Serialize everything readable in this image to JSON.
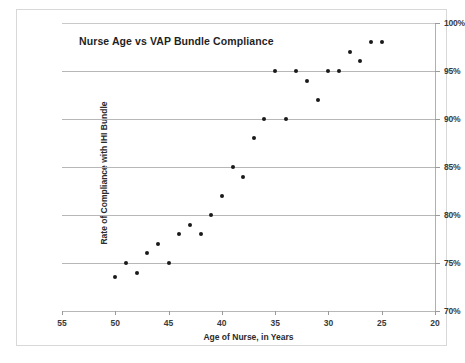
{
  "chart_data": {
    "type": "scatter",
    "title": "Nurse Age vs VAP Bundle Compliance",
    "xlabel": "Age of Nurse, in Years",
    "ylabel": "Rate of Compliance with IHI Bundle",
    "xlim": [
      55,
      20
    ],
    "ylim": [
      70,
      100
    ],
    "x_reversed": true,
    "grid": true,
    "legend": null,
    "y_axis_position": "right",
    "xticks": [
      55,
      50,
      45,
      40,
      35,
      30,
      25,
      20
    ],
    "xticklabels": [
      "55",
      "50",
      "45",
      "40",
      "35",
      "30",
      "25",
      "20"
    ],
    "yticks": [
      100,
      95,
      90,
      85,
      80,
      75,
      70
    ],
    "yticklabels": [
      "100%",
      "95%",
      "90%",
      "85%",
      "80%",
      "75%",
      "70%"
    ],
    "marker_color": "#1a1a1a",
    "gridline_color": "#b7b7b7",
    "points": [
      {
        "x": 50,
        "y": 73.5
      },
      {
        "x": 49,
        "y": 75
      },
      {
        "x": 48,
        "y": 74
      },
      {
        "x": 47,
        "y": 76
      },
      {
        "x": 46,
        "y": 77
      },
      {
        "x": 45,
        "y": 75
      },
      {
        "x": 44,
        "y": 78
      },
      {
        "x": 43,
        "y": 79
      },
      {
        "x": 42,
        "y": 78
      },
      {
        "x": 41,
        "y": 80
      },
      {
        "x": 40,
        "y": 82
      },
      {
        "x": 39,
        "y": 85
      },
      {
        "x": 38,
        "y": 84
      },
      {
        "x": 37,
        "y": 88
      },
      {
        "x": 36,
        "y": 90
      },
      {
        "x": 35,
        "y": 95
      },
      {
        "x": 34,
        "y": 90
      },
      {
        "x": 33,
        "y": 95
      },
      {
        "x": 32,
        "y": 94
      },
      {
        "x": 31,
        "y": 92
      },
      {
        "x": 30,
        "y": 95
      },
      {
        "x": 29,
        "y": 95
      },
      {
        "x": 28,
        "y": 97
      },
      {
        "x": 27,
        "y": 96
      },
      {
        "x": 26,
        "y": 98
      },
      {
        "x": 25,
        "y": 98
      }
    ]
  }
}
